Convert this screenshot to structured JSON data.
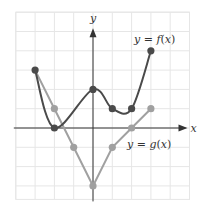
{
  "chart_data": {
    "type": "line",
    "title": "",
    "xlabel": "x",
    "ylabel": "y",
    "xlim": [
      -4,
      5
    ],
    "ylim": [
      -3.7,
      6
    ],
    "grid": true,
    "tick_labels_shown": false,
    "series": [
      {
        "name": "y = f(x)",
        "label_prefix": "y = ",
        "label_fn": "f",
        "label_arg": "(x)",
        "style": "smooth curve",
        "color": "#4a4a4a",
        "points": [
          [
            -3,
            3
          ],
          [
            -2,
            0
          ],
          [
            0,
            2
          ],
          [
            1,
            1
          ],
          [
            2,
            1
          ],
          [
            3,
            4
          ]
        ],
        "marked_points": [
          [
            -3,
            3
          ],
          [
            -2,
            0
          ],
          [
            0,
            2
          ],
          [
            1,
            1
          ],
          [
            2,
            1
          ],
          [
            3,
            4
          ]
        ]
      },
      {
        "name": "y = g(x)",
        "label_prefix": "y = ",
        "label_fn": "g",
        "label_arg": "(x)",
        "style": "piecewise linear",
        "color": "#a0a0a0",
        "points": [
          [
            -3,
            3
          ],
          [
            -2,
            1
          ],
          [
            -1,
            -1
          ],
          [
            0,
            -3
          ],
          [
            1,
            -1
          ],
          [
            2,
            0
          ],
          [
            3,
            1
          ]
        ],
        "marked_points": [
          [
            -2,
            1
          ],
          [
            -1,
            -1
          ],
          [
            0,
            -3
          ],
          [
            1,
            -1
          ],
          [
            2,
            0
          ],
          [
            3,
            1
          ]
        ]
      }
    ]
  },
  "colors": {
    "grid": "#e6e6e6",
    "axis": "#333333",
    "f_curve": "#4a4a4a",
    "g_curve": "#a0a0a0"
  },
  "axes": {
    "x_label": "x",
    "y_label": "y"
  }
}
